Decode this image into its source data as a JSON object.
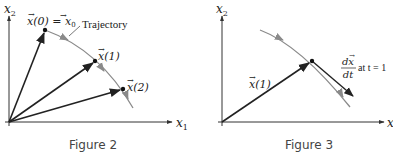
{
  "figures": [
    {
      "caption": "Figure 2",
      "axes": {
        "x_label": "x",
        "x_sub": "1",
        "y_label": "x",
        "y_sub": "2"
      },
      "trajectory_label": "Trajectory",
      "points": [
        {
          "label_main": "x(0) = x",
          "label_sub": "0",
          "name": "x0"
        },
        {
          "label_main": "x(1)",
          "name": "x1"
        },
        {
          "label_main": "x(2)",
          "name": "x2"
        }
      ]
    },
    {
      "caption": "Figure 3",
      "axes": {
        "x_label": "x",
        "y_label": "x",
        "y_sub": "2"
      },
      "point_label": "x(1)",
      "derivative_label": {
        "numerator": "dx",
        "denominator": "dt",
        "suffix": "at t = 1"
      }
    }
  ],
  "colors": {
    "vector": "#222222",
    "trajectory": "#8a8a8a",
    "axis": "#333333"
  }
}
